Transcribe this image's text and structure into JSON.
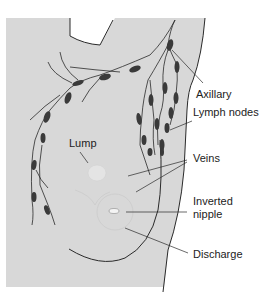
{
  "diagram": {
    "background_color": "#d8d8d8",
    "line_color": "#2a2a2a",
    "node_color": "#3a3a3a",
    "labels": {
      "axillary": "Axillary",
      "lymph_nodes": "Lymph nodes",
      "lump": "Lump",
      "veins": "Veins",
      "inverted": "Inverted",
      "nipple": "nipple",
      "discharge": "Discharge"
    }
  }
}
